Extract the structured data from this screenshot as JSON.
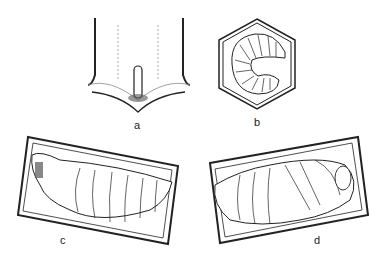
{
  "figure": {
    "panels": [
      {
        "id": "a",
        "label": "a",
        "description": "egg standing upright at base of cell"
      },
      {
        "id": "b",
        "label": "b",
        "description": "curled larva in hexagonal cell"
      },
      {
        "id": "c",
        "label": "c",
        "description": "prepupa/larva stretched in capped cell"
      },
      {
        "id": "d",
        "label": "d",
        "description": "pupa in capped cell"
      }
    ]
  }
}
